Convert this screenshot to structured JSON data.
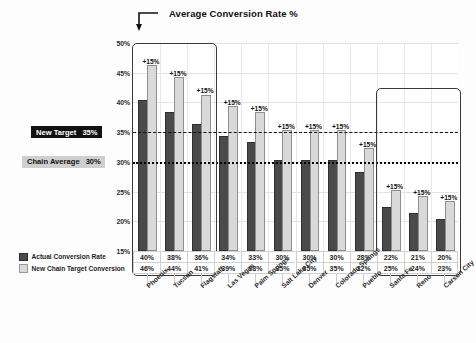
{
  "chart_data": {
    "type": "bar",
    "title": "Average Conversion Rate %",
    "xlabel": "",
    "ylabel": "",
    "ylim": [
      15,
      50
    ],
    "ytick_labels": [
      "50%",
      "45%",
      "40%",
      "35%",
      "30%",
      "25%",
      "20%",
      "15%"
    ],
    "ytick_values": [
      50,
      45,
      40,
      35,
      30,
      25,
      20,
      15
    ],
    "grid": true,
    "legend_position": "bottom-left",
    "categories": [
      "Phoenix",
      "Tucson",
      "Flagstaff",
      "Las Vegas",
      "Palm Springs",
      "Salt Lake City",
      "Denver",
      "Colorado Springs",
      "Pueblo",
      "Santa Fe",
      "Reno",
      "Carson City"
    ],
    "series": [
      {
        "name": "Actual Conversion Rate",
        "color": "#4a4a4a",
        "values": [
          40,
          38,
          36,
          34,
          33,
          30,
          30,
          30,
          28,
          22,
          21,
          20
        ],
        "value_labels": [
          "40%",
          "38%",
          "36%",
          "34%",
          "33%",
          "30%",
          "30%",
          "30%",
          "28%",
          "22%",
          "21%",
          "20%"
        ]
      },
      {
        "name": "New Chain Target Conversion",
        "color": "#d9d9d9",
        "values": [
          46,
          44,
          41,
          39,
          38,
          35,
          35,
          35,
          32,
          25,
          24,
          23
        ],
        "value_labels": [
          "46%",
          "44%",
          "41%",
          "39%",
          "38%",
          "35%",
          "35%",
          "35%",
          "32%",
          "25%",
          "24%",
          "23%"
        ]
      }
    ],
    "delta_labels": [
      "+15%",
      "+15%",
      "+15%",
      "+15%",
      "+15%",
      "+15%",
      "+15%",
      "+15%",
      "+15%",
      "+15%",
      "+15%",
      "+15%"
    ],
    "reference_lines": [
      {
        "name": "new-target",
        "label": "New Target",
        "value_label": "35%",
        "value": 35,
        "style": "dashed",
        "color": "#111111"
      },
      {
        "name": "chain-average",
        "label": "Chain Average",
        "value_label": "30%",
        "value": 30,
        "style": "dotted",
        "color": "#000000"
      }
    ],
    "highlight_boxes": [
      {
        "name": "top-performers",
        "from_category": "Phoenix",
        "to_category": "Flagstaff"
      },
      {
        "name": "under-performers",
        "from_category": "Santa Fe",
        "to_category": "Carson City"
      }
    ]
  },
  "legend": {
    "items": [
      {
        "label": "Actual Conversion Rate",
        "swatch": "dark"
      },
      {
        "label": "New Chain Target Conversion",
        "swatch": "light"
      }
    ]
  }
}
